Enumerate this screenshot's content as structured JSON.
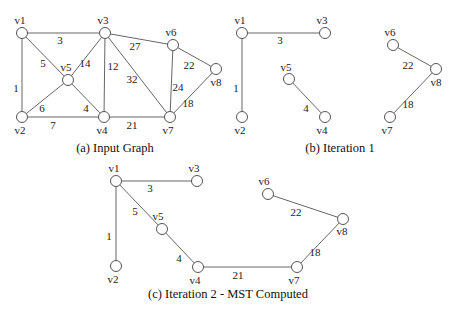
{
  "figure": {
    "panels": [
      {
        "id": "a",
        "caption": "(a)  Input Graph",
        "caption_pos": [
          115,
          152
        ],
        "nodes": [
          {
            "id": "v1",
            "x": 22,
            "y": 33,
            "lx": 20,
            "ly": 24
          },
          {
            "id": "v3",
            "x": 105,
            "y": 33,
            "lx": 103,
            "ly": 24
          },
          {
            "id": "v6",
            "x": 173,
            "y": 45,
            "lx": 171,
            "ly": 36
          },
          {
            "id": "v5",
            "x": 68,
            "y": 80,
            "lx": 66,
            "ly": 71
          },
          {
            "id": "v8",
            "x": 216,
            "y": 69,
            "lx": 216,
            "ly": 86
          },
          {
            "id": "v2",
            "x": 22,
            "y": 117,
            "lx": 20,
            "ly": 134
          },
          {
            "id": "v4",
            "x": 104,
            "y": 117,
            "lx": 102,
            "ly": 134
          },
          {
            "id": "v7",
            "x": 170,
            "y": 117,
            "lx": 168,
            "ly": 134
          }
        ],
        "edges": [
          {
            "from": "v1",
            "to": "v3",
            "w": "3",
            "wx": 60,
            "wy": 44
          },
          {
            "from": "v1",
            "to": "v2",
            "w": "1",
            "wx": 16,
            "wy": 92
          },
          {
            "from": "v1",
            "to": "v5",
            "w": "5",
            "wx": 43,
            "wy": 67
          },
          {
            "from": "v3",
            "to": "v5",
            "w": "14",
            "wx": 85,
            "wy": 67
          },
          {
            "from": "v3",
            "to": "v4",
            "w": "12",
            "wx": 113,
            "wy": 70
          },
          {
            "from": "v3",
            "to": "v7",
            "w": "32",
            "wx": 132,
            "wy": 83
          },
          {
            "from": "v3",
            "to": "v6",
            "w": "27",
            "wx": 135,
            "wy": 50
          },
          {
            "from": "v5",
            "to": "v2",
            "w": "6",
            "wx": 42,
            "wy": 112
          },
          {
            "from": "v5",
            "to": "v4",
            "w": "4",
            "wx": 86,
            "wy": 112
          },
          {
            "from": "v2",
            "to": "v4",
            "w": "7",
            "wx": 53,
            "wy": 129
          },
          {
            "from": "v4",
            "to": "v7",
            "w": "21",
            "wx": 132,
            "wy": 129
          },
          {
            "from": "v6",
            "to": "v7",
            "w": "24",
            "wx": 178,
            "wy": 91
          },
          {
            "from": "v6",
            "to": "v8",
            "w": "22",
            "wx": 189,
            "wy": 69
          },
          {
            "from": "v7",
            "to": "v8",
            "w": "18",
            "wx": 188,
            "wy": 107
          }
        ]
      },
      {
        "id": "b",
        "caption": "(b)  Iteration 1",
        "caption_pos": [
          340,
          152
        ],
        "nodes": [
          {
            "id": "v1",
            "x": 242,
            "y": 33,
            "lx": 240,
            "ly": 24
          },
          {
            "id": "v3",
            "x": 325,
            "y": 33,
            "lx": 322,
            "ly": 24
          },
          {
            "id": "v5",
            "x": 289,
            "y": 79,
            "lx": 286,
            "ly": 71
          },
          {
            "id": "v4",
            "x": 325,
            "y": 117,
            "lx": 322,
            "ly": 134
          },
          {
            "id": "v2",
            "x": 242,
            "y": 117,
            "lx": 240,
            "ly": 134
          },
          {
            "id": "v6",
            "x": 393,
            "y": 45,
            "lx": 390,
            "ly": 36
          },
          {
            "id": "v8",
            "x": 436,
            "y": 69,
            "lx": 436,
            "ly": 86
          },
          {
            "id": "v7",
            "x": 390,
            "y": 117,
            "lx": 387,
            "ly": 134
          }
        ],
        "edges": [
          {
            "from": "v1",
            "to": "v3",
            "w": "3",
            "wx": 280,
            "wy": 44
          },
          {
            "from": "v1",
            "to": "v2",
            "w": "1",
            "wx": 236,
            "wy": 92
          },
          {
            "from": "v5",
            "to": "v4",
            "w": "4",
            "wx": 306,
            "wy": 112
          },
          {
            "from": "v6",
            "to": "v8",
            "w": "22",
            "wx": 408,
            "wy": 69
          },
          {
            "from": "v7",
            "to": "v8",
            "w": "18",
            "wx": 408,
            "wy": 108
          }
        ]
      },
      {
        "id": "c",
        "caption": "(c)  Iteration 2 - MST Computed",
        "caption_pos": [
          228,
          298
        ],
        "nodes": [
          {
            "id": "v1",
            "x": 116,
            "y": 181,
            "lx": 114,
            "ly": 172
          },
          {
            "id": "v3",
            "x": 197,
            "y": 181,
            "lx": 194,
            "ly": 172
          },
          {
            "id": "v5",
            "x": 162,
            "y": 229,
            "lx": 158,
            "ly": 220
          },
          {
            "id": "v2",
            "x": 116,
            "y": 266,
            "lx": 113,
            "ly": 283
          },
          {
            "id": "v4",
            "x": 198,
            "y": 267,
            "lx": 195,
            "ly": 284
          },
          {
            "id": "v7",
            "x": 297,
            "y": 267,
            "lx": 294,
            "ly": 284
          },
          {
            "id": "v6",
            "x": 268,
            "y": 194,
            "lx": 264,
            "ly": 185
          },
          {
            "id": "v8",
            "x": 343,
            "y": 219,
            "lx": 342,
            "ly": 235
          }
        ],
        "edges": [
          {
            "from": "v1",
            "to": "v3",
            "w": "3",
            "wx": 150,
            "wy": 192
          },
          {
            "from": "v1",
            "to": "v2",
            "w": "1",
            "wx": 109,
            "wy": 240
          },
          {
            "from": "v1",
            "to": "v5",
            "w": "5",
            "wx": 135,
            "wy": 215
          },
          {
            "from": "v5",
            "to": "v4",
            "w": "4",
            "wx": 179,
            "wy": 262
          },
          {
            "from": "v4",
            "to": "v7",
            "w": "21",
            "wx": 238,
            "wy": 279
          },
          {
            "from": "v6",
            "to": "v8",
            "w": "22",
            "wx": 296,
            "wy": 216
          },
          {
            "from": "v7",
            "to": "v8",
            "w": "18",
            "wx": 315,
            "wy": 256
          }
        ]
      }
    ]
  }
}
